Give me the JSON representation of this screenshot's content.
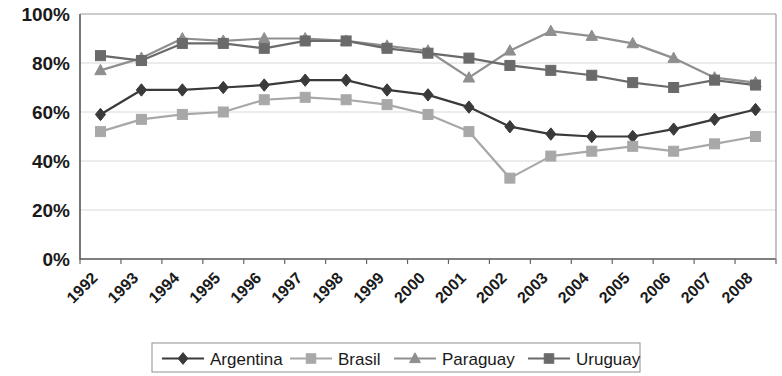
{
  "chart_data": {
    "type": "line",
    "title": "",
    "subtitle": "",
    "xlabel": "",
    "ylabel": "",
    "ylim": [
      0,
      100
    ],
    "y_tick_labels": [
      "0%",
      "20%",
      "40%",
      "60%",
      "80%",
      "100%"
    ],
    "y_ticks": [
      0,
      20,
      40,
      60,
      80,
      100
    ],
    "grid": true,
    "legend_position": "bottom",
    "x_tick_rotation": "-45",
    "categories": [
      "1992",
      "1993",
      "1994",
      "1995",
      "1996",
      "1997",
      "1998",
      "1999",
      "2000",
      "2001",
      "2002",
      "2003",
      "2004",
      "2005",
      "2006",
      "2007",
      "2008"
    ],
    "series": [
      {
        "name": "Argentina",
        "color": "#3a3a3a",
        "marker": "diamond",
        "values": [
          59,
          69,
          69,
          70,
          71,
          73,
          73,
          69,
          67,
          62,
          54,
          51,
          50,
          50,
          53,
          57,
          61
        ]
      },
      {
        "name": "Brasil",
        "color": "#a8a8a8",
        "marker": "square",
        "values": [
          52,
          57,
          59,
          60,
          65,
          66,
          65,
          63,
          59,
          52,
          33,
          42,
          44,
          46,
          44,
          47,
          50
        ]
      },
      {
        "name": "Paraguay",
        "color": "#8f8f8f",
        "marker": "triangle",
        "values": [
          77,
          82,
          90,
          89,
          90,
          90,
          89,
          87,
          85,
          74,
          85,
          93,
          91,
          88,
          82,
          74,
          72
        ]
      },
      {
        "name": "Uruguay",
        "color": "#6a6a6a",
        "marker": "square",
        "values": [
          83,
          81,
          88,
          88,
          86,
          89,
          89,
          86,
          84,
          82,
          79,
          77,
          75,
          72,
          70,
          73,
          71
        ]
      }
    ]
  },
  "legend": {
    "items": [
      {
        "label": "Argentina"
      },
      {
        "label": "Brasil"
      },
      {
        "label": "Paraguay"
      },
      {
        "label": "Uruguay"
      }
    ]
  }
}
